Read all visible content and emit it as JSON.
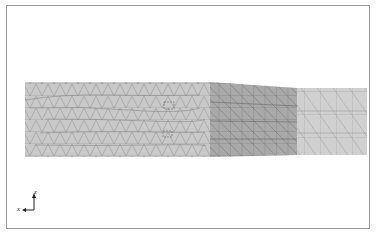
{
  "figure": {
    "type": "finite-element-mesh",
    "regions": [
      {
        "name": "left-region",
        "mesh": "unstructured triangles",
        "color": "#c8c8c8"
      },
      {
        "name": "middle-region",
        "mesh": "structured triangles",
        "color": "#a8a8a8"
      },
      {
        "name": "right-region",
        "mesh": "structured triangles",
        "color": "#cfcfcf"
      }
    ]
  },
  "axes": {
    "x_label": "x",
    "z_label": "z"
  }
}
